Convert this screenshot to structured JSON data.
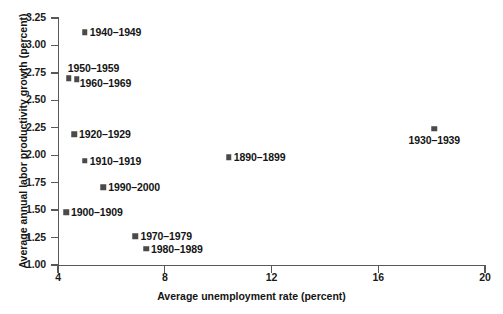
{
  "chart_data": {
    "type": "scatter",
    "title": "",
    "xlabel": "Average unemployment rate (percent)",
    "ylabel": "Average annual labor productivity growth (percent)",
    "xlim": [
      4,
      20
    ],
    "ylim": [
      1.0,
      3.25
    ],
    "xticks": [
      "4",
      "8",
      "12",
      "16",
      "20"
    ],
    "yticks": [
      "1.00",
      "1.25",
      "1.50",
      "1.75",
      "2.00",
      "2.25",
      "2.50",
      "2.75",
      "3.00",
      "3.25"
    ],
    "grid": false,
    "legend": "none",
    "marker_color": "#4a4a4a",
    "axis_color": "#585858",
    "points": [
      {
        "label": "1940–1949",
        "x": 5.0,
        "y": 3.12,
        "label_pos": "right"
      },
      {
        "label": "1950–1959",
        "x": 4.4,
        "y": 2.7,
        "label_pos": "above-right"
      },
      {
        "label": "1960–1969",
        "x": 4.7,
        "y": 2.69,
        "label_pos": "below-right"
      },
      {
        "label": "1920–1929",
        "x": 4.6,
        "y": 2.19,
        "label_pos": "right"
      },
      {
        "label": "1910–1919",
        "x": 5.0,
        "y": 1.95,
        "label_pos": "right"
      },
      {
        "label": "1990–2000",
        "x": 5.7,
        "y": 1.71,
        "label_pos": "right"
      },
      {
        "label": "1900–1909",
        "x": 4.3,
        "y": 1.48,
        "label_pos": "right"
      },
      {
        "label": "1970–1979",
        "x": 6.9,
        "y": 1.26,
        "label_pos": "right"
      },
      {
        "label": "1980–1989",
        "x": 7.3,
        "y": 1.15,
        "label_pos": "right"
      },
      {
        "label": "1890–1899",
        "x": 10.4,
        "y": 1.98,
        "label_pos": "right"
      },
      {
        "label": "1930–1939",
        "x": 18.1,
        "y": 2.24,
        "label_pos": "below-center"
      }
    ]
  }
}
